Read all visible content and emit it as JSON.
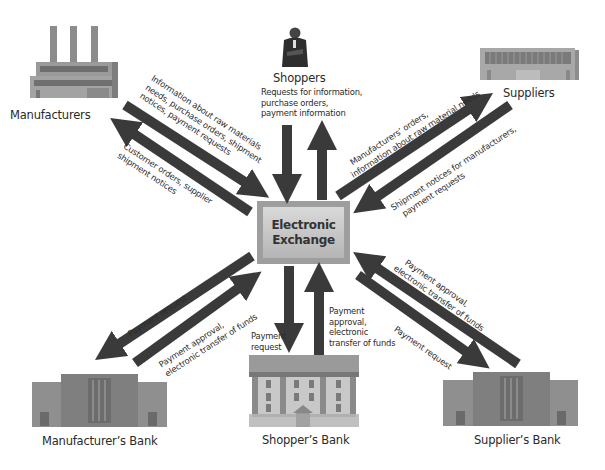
{
  "hub": {
    "line1": "Electronic",
    "line2": "Exchange"
  },
  "nodes": {
    "manufacturers": {
      "label": "Manufacturers",
      "icon": "factory-icon"
    },
    "shoppers": {
      "label": "Shoppers",
      "icon": "businessman-icon"
    },
    "suppliers": {
      "label": "Suppliers",
      "icon": "warehouse-icon"
    },
    "manufacturers_bank": {
      "label": "Manufacturer’s  Bank",
      "icon": "bank-building-icon"
    },
    "shoppers_bank": {
      "label": "Shopper’s  Bank",
      "icon": "columned-bank-icon"
    },
    "suppliers_bank": {
      "label": "Supplier’s Bank",
      "icon": "bank-building-icon"
    }
  },
  "flows": {
    "manufacturers_to_exchange": [
      "Information about raw materials",
      "needs, purchase orders, shipment",
      "notices, payment requests"
    ],
    "exchange_to_manufacturers": [
      "Customer orders, supplier",
      "shipment notices"
    ],
    "shoppers_to_exchange": [
      "Requests for information,",
      "purchase orders,",
      "payment information"
    ],
    "exchange_to_suppliers": [
      "Manufacturers’ orders,",
      "information about raw material needs"
    ],
    "suppliers_to_exchange": [
      "Shipment notices for manufacturers,",
      "payment requests"
    ],
    "exchange_to_manufacturers_bank": [
      "Payment request"
    ],
    "manufacturers_bank_to_exchange": [
      "Payment approval,",
      "electronic transfer of funds"
    ],
    "exchange_to_shoppers_bank": [
      "Payment",
      "request"
    ],
    "shoppers_bank_to_exchange": [
      "Payment",
      "approval,",
      "electronic",
      "transfer of funds"
    ],
    "suppliers_bank_to_exchange": [
      "Payment approval,",
      "electronic transfer of funds"
    ],
    "exchange_to_suppliers_bank": [
      "Payment request"
    ]
  },
  "colors": {
    "arrow": "#3a3a3a",
    "building": "#8f8f8f",
    "hub_outer": "#a6a6a6",
    "hub_inner": "#cfcfcf"
  }
}
